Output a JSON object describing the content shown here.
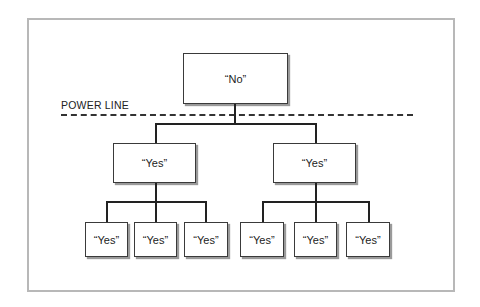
{
  "diagram": {
    "divider_label": "POWER LINE",
    "root": {
      "label": "“No”"
    },
    "level2": [
      {
        "label": "“Yes”"
      },
      {
        "label": "“Yes”"
      }
    ],
    "level3": [
      {
        "label": "“Yes”"
      },
      {
        "label": "“Yes”"
      },
      {
        "label": "“Yes”"
      },
      {
        "label": "“Yes”"
      },
      {
        "label": "“Yes”"
      },
      {
        "label": "“Yes”"
      }
    ]
  }
}
